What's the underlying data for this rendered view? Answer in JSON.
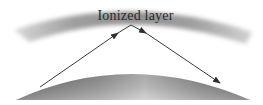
{
  "diagram": {
    "labels": {
      "ionized_layer": "Ionized layer"
    },
    "elements": {
      "ionized_layer": {
        "shape": "curved band",
        "color": "#8a8a8a"
      },
      "earth_surface": {
        "shape": "curved dome",
        "color": "#8c8c8c"
      },
      "incident_ray": {
        "from": "earth surface left",
        "to": "ionized layer apex",
        "color": "#3a3a3a"
      },
      "reflected_ray": {
        "from": "ionized layer apex",
        "to": "earth surface right",
        "color": "#3a3a3a"
      }
    }
  }
}
